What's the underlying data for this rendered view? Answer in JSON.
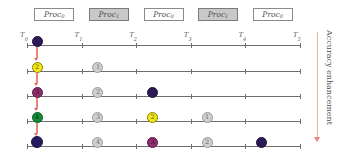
{
  "figure": {
    "proc_boxes": [
      {
        "label": "Proc",
        "sub": "0",
        "style": "white"
      },
      {
        "label": "Proc",
        "sub": "1",
        "style": "gray"
      },
      {
        "label": "Proc",
        "sub": "0",
        "style": "white"
      },
      {
        "label": "Proc",
        "sub": "1",
        "style": "gray"
      },
      {
        "label": "Proc",
        "sub": "0",
        "style": "white"
      }
    ],
    "time_labels": [
      {
        "label": "T",
        "sub": "0"
      },
      {
        "label": "T",
        "sub": "1"
      },
      {
        "label": "T",
        "sub": "2"
      },
      {
        "label": "T",
        "sub": "3"
      },
      {
        "label": "T",
        "sub": "4"
      },
      {
        "label": "T",
        "sub": "5"
      }
    ],
    "rows": [
      {
        "nodes": [
          {
            "slot": 0,
            "number": "1",
            "color": "dark",
            "hex": "#2b1a55",
            "size": 11
          }
        ]
      },
      {
        "nodes": [
          {
            "slot": 0,
            "number": "2",
            "color": "yellow",
            "hex": "#f2e71a",
            "size": 11
          },
          {
            "slot": 1,
            "number": "1",
            "color": "gray",
            "hex": "#cfcfcf",
            "size": 11
          }
        ]
      },
      {
        "nodes": [
          {
            "slot": 0,
            "number": "3",
            "color": "magenta",
            "hex": "#8e2f6d",
            "size": 11
          },
          {
            "slot": 1,
            "number": "2",
            "color": "gray",
            "hex": "#cfcfcf",
            "size": 11
          },
          {
            "slot": 2,
            "number": "1",
            "color": "dark",
            "hex": "#2b1a55",
            "size": 11
          }
        ]
      },
      {
        "nodes": [
          {
            "slot": 0,
            "number": "4",
            "color": "green",
            "hex": "#118c36",
            "size": 11
          },
          {
            "slot": 1,
            "number": "3",
            "color": "gray",
            "hex": "#cfcfcf",
            "size": 11
          },
          {
            "slot": 2,
            "number": "2",
            "color": "yellow",
            "hex": "#f2e71a",
            "size": 11
          },
          {
            "slot": 3,
            "number": "1",
            "color": "gray",
            "hex": "#cfcfcf",
            "size": 11
          }
        ]
      },
      {
        "nodes": [
          {
            "slot": 0,
            "number": "5",
            "color": "dark",
            "hex": "#241a5e",
            "size": 12
          },
          {
            "slot": 1,
            "number": "4",
            "color": "gray",
            "hex": "#cfcfcf",
            "size": 11
          },
          {
            "slot": 2,
            "number": "3",
            "color": "magenta",
            "hex": "#8e2f6d",
            "size": 11
          },
          {
            "slot": 3,
            "number": "2",
            "color": "gray",
            "hex": "#cfcfcf",
            "size": 11
          },
          {
            "slot": 4,
            "number": "1",
            "color": "dark",
            "hex": "#2b1a55",
            "size": 11
          }
        ]
      }
    ],
    "accuracy_arrow": {
      "label": "Accuracy enhancement",
      "direction": "down",
      "color": "#e8857d"
    },
    "colors": {
      "axis": "#6f6f6f",
      "proc_white": "#ffffff",
      "proc_gray": "#c9c9c9",
      "arrow_red": "#e8857d"
    }
  }
}
